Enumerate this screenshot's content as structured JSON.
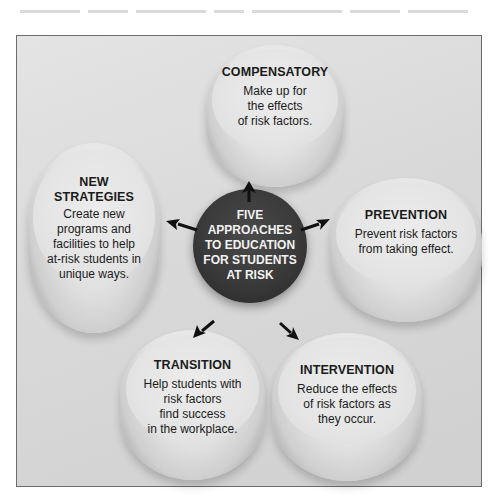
{
  "diagram": {
    "center": {
      "lines": [
        "FIVE",
        "APPROACHES",
        "TO EDUCATION",
        "FOR STUDENTS",
        "AT RISK"
      ]
    },
    "approaches": [
      {
        "id": "compensatory",
        "title_lines": [
          "COMPENSATORY"
        ],
        "desc_lines": [
          "Make up for",
          "the effects",
          "of risk factors."
        ]
      },
      {
        "id": "prevention",
        "title_lines": [
          "PREVENTION"
        ],
        "desc_lines": [
          "Prevent risk factors",
          "from taking effect."
        ]
      },
      {
        "id": "intervention",
        "title_lines": [
          "INTERVENTION"
        ],
        "desc_lines": [
          "Reduce the effects",
          "of risk factors as",
          "they occur."
        ]
      },
      {
        "id": "transition",
        "title_lines": [
          "TRANSITION"
        ],
        "desc_lines": [
          "Help students with",
          "risk factors",
          "find success",
          "in the workplace."
        ]
      },
      {
        "id": "new-strategies",
        "title_lines": [
          "NEW",
          "STRATEGIES"
        ],
        "desc_lines": [
          "Create new",
          "programs and",
          "facilities to help",
          "at-risk students in",
          "unique ways."
        ]
      }
    ],
    "colors": {
      "center_fill": "#3a3a3a",
      "center_text": "#f2f2f2",
      "disc_fill": "#e3e3e3",
      "frame_bg": "#d9d9d9",
      "frame_border": "#6d6d6d",
      "arrow": "#111111"
    }
  }
}
